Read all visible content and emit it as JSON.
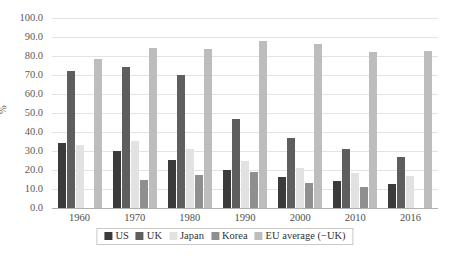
{
  "chart_data": {
    "type": "bar",
    "title": "",
    "subtitle": "",
    "xlabel": "",
    "ylabel": "%",
    "ylim": [
      0,
      100
    ],
    "ytick_step": 10,
    "ytick_labels": [
      "0.0",
      "10.0",
      "20.0",
      "30.0",
      "40.0",
      "50.0",
      "60.0",
      "70.0",
      "80.0",
      "90.0",
      "100.0"
    ],
    "grid": true,
    "legend_position": "bottom",
    "categories": [
      "1960",
      "1970",
      "1980",
      "1990",
      "2000",
      "2010",
      "2016"
    ],
    "series": [
      {
        "name": "US",
        "color": "#3b3b3b",
        "values": [
          34.0,
          30.0,
          25.2,
          20.0,
          16.2,
          14.0,
          12.8
        ]
      },
      {
        "name": "UK",
        "color": "#5e5e5e",
        "values": [
          72.0,
          74.0,
          70.2,
          47.0,
          36.8,
          31.0,
          27.0
        ]
      },
      {
        "name": "Japan",
        "color": "#e2e2e2",
        "values": [
          33.0,
          35.5,
          31.0,
          25.0,
          21.0,
          18.5,
          17.0
        ]
      },
      {
        "name": "Korea",
        "color": "#8f8f8f",
        "values": [
          null,
          15.0,
          17.5,
          19.2,
          13.0,
          11.0,
          null
        ]
      },
      {
        "name": "EU average (−UK)",
        "color": "#bdbdbd",
        "values": [
          78.5,
          84.0,
          83.5,
          88.0,
          86.5,
          82.0,
          82.5
        ]
      }
    ]
  },
  "legend": {
    "entries": [
      {
        "label": "US"
      },
      {
        "label": "UK"
      },
      {
        "label": "Japan"
      },
      {
        "label": "Korea"
      },
      {
        "label": "EU average (−UK)"
      }
    ]
  },
  "colors": {
    "background": "#ffffff",
    "gridline": "#e3e3e3",
    "axis": "#b0b0b0",
    "tick_text": "#595959",
    "legend_border": "#c8c8c8"
  }
}
